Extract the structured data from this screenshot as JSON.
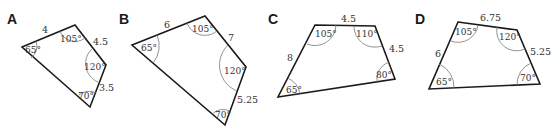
{
  "figures": [
    {
      "label": "A",
      "sides": [
        "4",
        "4.5",
        "3.5"
      ],
      "angles": [
        "65°",
        "105°",
        "120°",
        "70°"
      ]
    },
    {
      "label": "B",
      "sides": [
        "6",
        "7",
        "5.25"
      ],
      "angles": [
        "65°",
        "105°",
        "120°",
        "70°"
      ]
    },
    {
      "label": "C",
      "sides": [
        "4.5",
        "8",
        "4.5"
      ],
      "angles": [
        "105°",
        "110°",
        "65°",
        "80°"
      ]
    },
    {
      "label": "D",
      "sides": [
        "6.75",
        "6",
        "5.25"
      ],
      "angles": [
        "105°",
        "120°",
        "65°",
        "70°"
      ]
    }
  ]
}
